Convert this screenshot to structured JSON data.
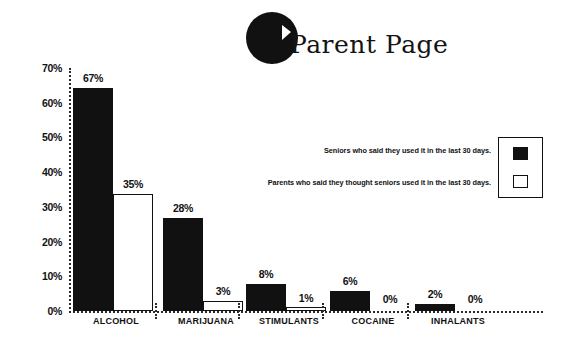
{
  "logo": {
    "text": "Parent Page",
    "icon": "circle-p-logo"
  },
  "chart_data": {
    "type": "bar",
    "title": "Parent Page",
    "xlabel": "",
    "ylabel": "",
    "ylim": [
      0,
      70
    ],
    "grid": false,
    "legend_position": "right",
    "categories": [
      "ALCOHOL",
      "MARIJUANA",
      "STIMULANTS",
      "COCAINE",
      "INHALANTS"
    ],
    "ytick_labels": [
      "70%",
      "60%",
      "50%",
      "40%",
      "30%",
      "20%",
      "10%",
      "0%"
    ],
    "ytick_values": [
      70,
      60,
      50,
      40,
      30,
      20,
      10,
      0
    ],
    "series": [
      {
        "name": "Seniors who said they used it in the last 30 days.",
        "style": "solid-black",
        "values": [
          67,
          28,
          8,
          6,
          2
        ],
        "labels": [
          "67%",
          "28%",
          "8%",
          "6%",
          "2%"
        ]
      },
      {
        "name": "Parents who said they thought seniors used it in the last 30 days.",
        "style": "hollow-white",
        "values": [
          35,
          3,
          1,
          0,
          0
        ],
        "labels": [
          "35%",
          "3%",
          "1%",
          "0%",
          "0%"
        ]
      }
    ]
  },
  "legend": {
    "entries": [
      {
        "label": "Seniors who said they used it in the last 30 days.",
        "swatch": "solid-black"
      },
      {
        "label": "Parents who said they thought seniors used it in the last 30 days.",
        "swatch": "hollow-white"
      }
    ]
  }
}
